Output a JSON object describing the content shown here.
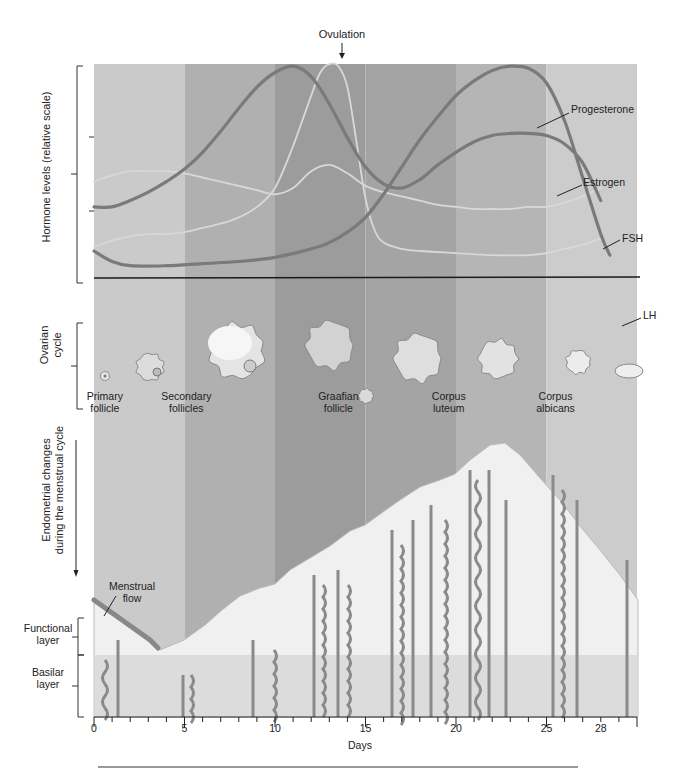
{
  "title_annotation": {
    "ovulation_label": "Ovulation",
    "ovulation_day": 13.5
  },
  "x_axis": {
    "label": "Days",
    "tick_labels": [
      "0",
      "5",
      "10",
      "15",
      "20",
      "25",
      "28"
    ],
    "tick_days": [
      0,
      5,
      10,
      15,
      20,
      25,
      28
    ],
    "min_day": 0,
    "max_day": 30
  },
  "bands": [
    {
      "from": 0,
      "to": 5,
      "color": "#cacaca"
    },
    {
      "from": 5,
      "to": 10,
      "color": "#b0b0b0"
    },
    {
      "from": 10,
      "to": 15,
      "color": "#9c9c9c"
    },
    {
      "from": 15,
      "to": 20,
      "color": "#a4a4a4"
    },
    {
      "from": 20,
      "to": 25,
      "color": "#b5b5b5"
    },
    {
      "from": 25,
      "to": 30,
      "color": "#cccccc"
    }
  ],
  "sections": {
    "hormones": {
      "ylabel": "Hormone levels (relative scale)"
    },
    "ovarian": {
      "ylabel_line1": "Ovarian",
      "ylabel_line2": "cycle"
    },
    "endometrial": {
      "ylabel_line1": "Endometrial changes",
      "ylabel_line2": "during the menstrual cycle"
    },
    "layers": {
      "functional_line1": "Functional",
      "functional_line2": "layer",
      "basilar_line1": "Basilar",
      "basilar_line2": "layer",
      "menstrual_line1": "Menstrual",
      "menstrual_line2": "flow"
    }
  },
  "ovarian_stages": [
    {
      "line1": "Primary",
      "line2": "follicle",
      "day": 0.6
    },
    {
      "line1": "Secondary",
      "line2": "follicles",
      "day": 5.1
    },
    {
      "line1": "Graafian",
      "line2": "follicle",
      "day": 13.5
    },
    {
      "line1": "Corpus",
      "line2": "luteum",
      "day": 19.6
    },
    {
      "line1": "Corpus",
      "line2": "albicans",
      "day": 25.5
    }
  ],
  "chart_data": {
    "type": "line",
    "xlabel": "Days",
    "ylabel": "Hormone levels (relative scale)",
    "xlim": [
      0,
      30
    ],
    "ylim": [
      0,
      100
    ],
    "grid": false,
    "legend_position": "inline-right",
    "annotations": [
      "Ovulation (day ~13.5)"
    ],
    "series": [
      {
        "name": "Progesterone",
        "color": "#7a7a7a",
        "width": 3.2,
        "x": [
          0,
          1,
          2,
          4,
          6,
          8,
          10,
          12,
          13,
          14,
          15,
          16,
          17,
          18,
          19,
          20,
          21,
          22,
          23,
          24,
          25,
          26,
          27,
          28,
          28.5
        ],
        "y": [
          10,
          5,
          3,
          3,
          4,
          5,
          7,
          11,
          14,
          19,
          26,
          37,
          50,
          63,
          74,
          84,
          91,
          96,
          98,
          97,
          90,
          72,
          45,
          18,
          8
        ]
      },
      {
        "name": "Estrogen",
        "color": "#7a7a7a",
        "width": 3.2,
        "x": [
          0,
          1,
          2,
          3,
          4,
          5,
          6,
          7,
          8,
          9,
          10,
          11,
          12,
          13,
          14,
          15,
          16,
          17,
          18,
          19,
          20,
          21,
          22,
          23,
          24,
          25,
          26,
          27,
          28
        ],
        "y": [
          31,
          31,
          34,
          38,
          43,
          49,
          57,
          67,
          78,
          88,
          95,
          98,
          93,
          80,
          64,
          50,
          42,
          40,
          44,
          51,
          57,
          62,
          65,
          66,
          66,
          65,
          61,
          52,
          34
        ]
      },
      {
        "name": "FSH",
        "color": "#d8d8d8",
        "width": 1.8,
        "x": [
          0,
          1,
          2,
          3,
          4,
          5,
          6,
          7,
          8,
          9,
          10,
          11,
          12,
          13,
          14,
          15,
          16,
          17,
          18,
          19,
          20,
          21,
          22,
          23,
          24,
          25,
          26,
          27,
          28
        ],
        "y": [
          43,
          46,
          48,
          48,
          48,
          47,
          45,
          43,
          41,
          39,
          37,
          40,
          48,
          51,
          47,
          41,
          38,
          36,
          34,
          32,
          31,
          30,
          30,
          30,
          31,
          31,
          33,
          36,
          40
        ]
      },
      {
        "name": "LH",
        "color": "#d8d8d8",
        "width": 1.8,
        "x": [
          0,
          1,
          2,
          3,
          4,
          5,
          6,
          7,
          8,
          9,
          10,
          11,
          12,
          12.5,
          13,
          13.5,
          14,
          14.5,
          15,
          15.5,
          16,
          17,
          18,
          20,
          22,
          24,
          25,
          26,
          27,
          28
        ],
        "y": [
          12,
          15,
          17,
          18,
          18,
          19,
          21,
          23,
          26,
          31,
          40,
          60,
          84,
          95,
          99,
          98,
          88,
          62,
          35,
          20,
          14,
          11,
          10,
          9,
          8,
          8,
          9,
          11,
          13,
          16
        ]
      }
    ]
  },
  "series_labels": [
    {
      "name": "Progesterone",
      "label_x": 572,
      "label_y": 109,
      "line": [
        566,
        112,
        537,
        128
      ]
    },
    {
      "name": "Estrogen",
      "label_x": 584,
      "label_y": 181,
      "line": [
        578,
        184,
        557,
        193
      ]
    },
    {
      "name": "FSH",
      "label_x": 622,
      "label_y": 237,
      "line": [
        618,
        237,
        602,
        246
      ]
    },
    {
      "name": "LH",
      "label_x": 643,
      "label_y": 316,
      "line": [
        637,
        316,
        621,
        324
      ]
    }
  ]
}
